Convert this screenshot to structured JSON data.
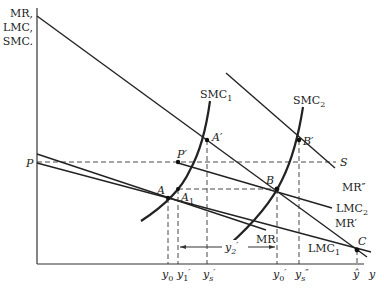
{
  "axes": {
    "y_label_lines": [
      "MR,",
      "LMC,",
      "SMC."
    ],
    "x_label": "y",
    "price_label": "P",
    "supply_label": "S"
  },
  "curves": {
    "smc1": "SMC",
    "smc1_sub": "1",
    "smc2": "SMC",
    "smc2_sub": "2",
    "mr": "MR",
    "mr_prime": "MR′",
    "mr_double_prime": "MR″",
    "lmc1": "LMC",
    "lmc1_sub": "1",
    "lmc2": "LMC",
    "lmc2_sub": "2"
  },
  "points": {
    "A": "A",
    "A1": "A",
    "A1_sub": "1",
    "A_prime": "A′",
    "B": "B",
    "B_prime": "B′",
    "C": "C",
    "P_prime": "P′"
  },
  "x_ticks": {
    "y0": "y",
    "y0_sub": "0",
    "y1p": "y",
    "y1p_sub": "1",
    "y1p_mark": "′",
    "ysp": "y",
    "ysp_sub": "s",
    "ysp_mark": "′",
    "y2p": "y",
    "y2p_sub": "2",
    "y2p_mark": "′",
    "y0p": "y",
    "y0p_sub": "0",
    "y0p_mark": "′",
    "yspp": "y",
    "yspp_sub": "s",
    "yspp_mark": "″",
    "yhat": "ŷ"
  }
}
